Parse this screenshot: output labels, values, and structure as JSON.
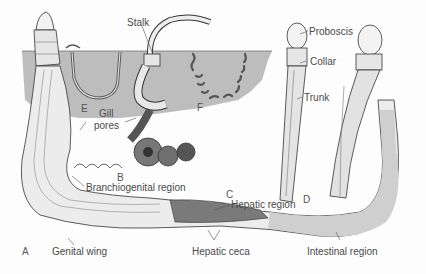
{
  "figure": {
    "colors": {
      "mud": "#bdbdbd",
      "body_fill": "#ececec",
      "outline": "#3a3a3a",
      "dark_coil": "#6a6a6a",
      "label_text": "#4a4a4a"
    },
    "panel_letters": {
      "A": "A",
      "B": "B",
      "C": "C",
      "D": "D",
      "E": "E",
      "F": "F"
    },
    "labels": {
      "stalk": "Stalk",
      "proboscis": "Proboscis",
      "collar": "Collar",
      "trunk": "Trunk",
      "gill_pores_1": "Gill",
      "gill_pores_2": "pores",
      "branchiogenital_region": "Branchiogenital region",
      "hepatic_region": "Hepatic region",
      "genital_wing": "Genital wing",
      "hepatic_ceca": "Hepatic ceca",
      "intestinal_region": "Intestinal region"
    }
  }
}
